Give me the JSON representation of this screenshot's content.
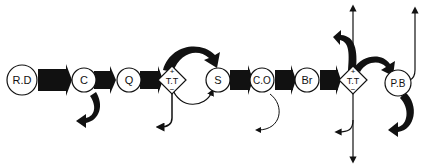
{
  "diagram": {
    "type": "flow-chain",
    "nodes": [
      {
        "id": "rd",
        "label": "R.D",
        "shape": "circle"
      },
      {
        "id": "c",
        "label": "C",
        "shape": "circle"
      },
      {
        "id": "q",
        "label": "Q",
        "shape": "circle"
      },
      {
        "id": "tt1",
        "label": "T.T",
        "shape": "diamond",
        "top_sign": "+",
        "bottom_sign": "−"
      },
      {
        "id": "s",
        "label": "S",
        "shape": "circle"
      },
      {
        "id": "co",
        "label": "C.O",
        "shape": "circle"
      },
      {
        "id": "br",
        "label": "Br",
        "shape": "circle"
      },
      {
        "id": "tt2",
        "label": "T.T",
        "shape": "diamond",
        "top_sign": "+",
        "bottom_sign": "−"
      },
      {
        "id": "pb",
        "label": "P.B",
        "shape": "circle"
      }
    ],
    "edges": [
      {
        "from": "rd",
        "to": "c",
        "style": "thick-arrow"
      },
      {
        "from": "c",
        "to": "q",
        "style": "thick-arrow"
      },
      {
        "from": "q",
        "to": "tt1",
        "style": "thick-arrow"
      },
      {
        "from": "tt1",
        "to": "s",
        "style": "thick-curved-arrow-over"
      },
      {
        "from": "tt1",
        "to": "s",
        "style": "thin-curved-arrow-under"
      },
      {
        "from": "s",
        "to": "co",
        "style": "thick-arrow"
      },
      {
        "from": "co",
        "to": "br",
        "style": "thick-arrow"
      },
      {
        "from": "br",
        "to": "tt2",
        "style": "thick-arrow"
      },
      {
        "from": "tt2",
        "to": "pb",
        "style": "thick-curved-arrow-over"
      },
      {
        "from": "c",
        "to": "out",
        "style": "thick-curved-arrow-down-left"
      },
      {
        "from": "tt1",
        "to": "out",
        "style": "thin-arrow-down-left"
      },
      {
        "from": "co",
        "to": "out",
        "style": "thin-curved-arrow-down-left"
      },
      {
        "from": "tt2",
        "to": "out",
        "style": "thick-curved-arrow-up-left"
      },
      {
        "from": "tt2",
        "to": "out",
        "style": "thin-arrow-up"
      },
      {
        "from": "tt2",
        "to": "out",
        "style": "thin-arrow-down"
      },
      {
        "from": "tt2",
        "to": "out",
        "style": "thin-arrow-down-left"
      },
      {
        "from": "pb",
        "to": "out",
        "style": "thin-arrow-up"
      },
      {
        "from": "pb",
        "to": "out",
        "style": "thick-curved-arrow-down-left"
      }
    ]
  }
}
